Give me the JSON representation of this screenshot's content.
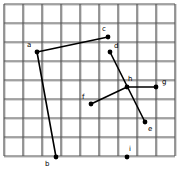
{
  "figure": {
    "name": "grid-point-diagram",
    "background_color": "#ffffff",
    "grid": {
      "line_color": "#555555",
      "minor_line_color": "#c8c8c8",
      "x_start": 4,
      "y_start": 4,
      "cell_size": 19,
      "cols": 9,
      "rows": 8,
      "width": 171,
      "height": 152
    },
    "style": {
      "segment_color": "#000000",
      "segment_width": 1.6,
      "point_color": "#000000",
      "point_radius": 2.4,
      "label_color": "#000000"
    },
    "points": [
      {
        "id": "a",
        "label": "a",
        "x": 37,
        "y": 52,
        "label_x": 27,
        "label_y": 42
      },
      {
        "id": "b",
        "label": "b",
        "x": 56,
        "y": 157,
        "label_x": 45,
        "label_y": 161
      },
      {
        "id": "c",
        "label": "c",
        "x": 108,
        "y": 37,
        "label_x": 102,
        "label_y": 26
      },
      {
        "id": "d",
        "label": "d",
        "x": 110,
        "y": 52,
        "label_x": 114,
        "label_y": 43
      },
      {
        "id": "e",
        "label": "e",
        "x": 145,
        "y": 122,
        "label_x": 148,
        "label_y": 126
      },
      {
        "id": "f",
        "label": "f",
        "x": 91,
        "y": 104,
        "label_x": 82,
        "label_y": 94
      },
      {
        "id": "g",
        "label": "g",
        "x": 156,
        "y": 87,
        "label_x": 162,
        "label_y": 79
      },
      {
        "id": "h",
        "label": "h",
        "x": 127,
        "y": 87,
        "label_x": 128,
        "label_y": 76
      },
      {
        "id": "i",
        "label": "i",
        "x": 127,
        "y": 157,
        "label_x": 129,
        "label_y": 146
      }
    ],
    "segments": [
      {
        "from": "a",
        "to": "c"
      },
      {
        "from": "a",
        "to": "b"
      },
      {
        "from": "d",
        "to": "e"
      },
      {
        "from": "f",
        "to": "h"
      },
      {
        "from": "h",
        "to": "g"
      }
    ]
  }
}
